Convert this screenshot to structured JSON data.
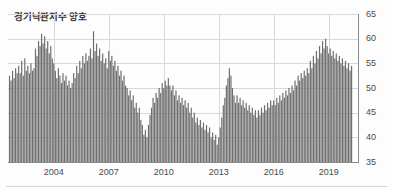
{
  "chart_data": {
    "type": "bar",
    "title": "경기낙관지수 양호",
    "xlabel": "",
    "ylabel": "",
    "ylim": [
      35,
      65
    ],
    "yticks": [
      35,
      40,
      45,
      50,
      55,
      60,
      65
    ],
    "xticks": [
      2004,
      2007,
      2010,
      2013,
      2016,
      2019
    ],
    "xlim": [
      2001.5,
      2020.6
    ],
    "grid": true,
    "legend": null,
    "bar_color": "#6e6e6e",
    "x_start": 2001.583,
    "x_step_months": 1,
    "categories": [
      "2001-08",
      "2001-09",
      "2001-10",
      "2001-11",
      "2001-12",
      "2002-01",
      "2002-02",
      "2002-03",
      "2002-04",
      "2002-05",
      "2002-06",
      "2002-07",
      "2002-08",
      "2002-09",
      "2002-10",
      "2002-11",
      "2002-12",
      "2003-01",
      "2003-02",
      "2003-03",
      "2003-04",
      "2003-05",
      "2003-06",
      "2003-07",
      "2003-08",
      "2003-09",
      "2003-10",
      "2003-11",
      "2003-12",
      "2004-01",
      "2004-02",
      "2004-03",
      "2004-04",
      "2004-05",
      "2004-06",
      "2004-07",
      "2004-08",
      "2004-09",
      "2004-10",
      "2004-11",
      "2004-12",
      "2005-01",
      "2005-02",
      "2005-03",
      "2005-04",
      "2005-05",
      "2005-06",
      "2005-07",
      "2005-08",
      "2005-09",
      "2005-10",
      "2005-11",
      "2005-12",
      "2006-01",
      "2006-02",
      "2006-03",
      "2006-04",
      "2006-05",
      "2006-06",
      "2006-07",
      "2006-08",
      "2006-09",
      "2006-10",
      "2006-11",
      "2006-12",
      "2007-01",
      "2007-02",
      "2007-03",
      "2007-04",
      "2007-05",
      "2007-06",
      "2007-07",
      "2007-08",
      "2007-09",
      "2007-10",
      "2007-11",
      "2007-12",
      "2008-01",
      "2008-02",
      "2008-03",
      "2008-04",
      "2008-05",
      "2008-06",
      "2008-07",
      "2008-08",
      "2008-09",
      "2008-10",
      "2008-11",
      "2008-12",
      "2009-01",
      "2009-02",
      "2009-03",
      "2009-04",
      "2009-05",
      "2009-06",
      "2009-07",
      "2009-08",
      "2009-09",
      "2009-10",
      "2009-11",
      "2009-12",
      "2010-01",
      "2010-02",
      "2010-03",
      "2010-04",
      "2010-05",
      "2010-06",
      "2010-07",
      "2010-08",
      "2010-09",
      "2010-10",
      "2010-11",
      "2010-12",
      "2011-01",
      "2011-02",
      "2011-03",
      "2011-04",
      "2011-05",
      "2011-06",
      "2011-07",
      "2011-08",
      "2011-09",
      "2011-10",
      "2011-11",
      "2011-12",
      "2012-01",
      "2012-02",
      "2012-03",
      "2012-04",
      "2012-05",
      "2012-06",
      "2012-07",
      "2012-08",
      "2012-09",
      "2012-10",
      "2012-11",
      "2012-12",
      "2013-01",
      "2013-02",
      "2013-03",
      "2013-04",
      "2013-05",
      "2013-06",
      "2013-07",
      "2013-08",
      "2013-09",
      "2013-10",
      "2013-11",
      "2013-12",
      "2014-01",
      "2014-02",
      "2014-03",
      "2014-04",
      "2014-05",
      "2014-06",
      "2014-07",
      "2014-08",
      "2014-09",
      "2014-10",
      "2014-11",
      "2014-12",
      "2015-01",
      "2015-02",
      "2015-03",
      "2015-04",
      "2015-05",
      "2015-06",
      "2015-07",
      "2015-08",
      "2015-09",
      "2015-10",
      "2015-11",
      "2015-12",
      "2016-01",
      "2016-02",
      "2016-03",
      "2016-04",
      "2016-05",
      "2016-06",
      "2016-07",
      "2016-08",
      "2016-09",
      "2016-10",
      "2016-11",
      "2016-12",
      "2017-01",
      "2017-02",
      "2017-03",
      "2017-04",
      "2017-05",
      "2017-06",
      "2017-07",
      "2017-08",
      "2017-09",
      "2017-10",
      "2017-11",
      "2017-12",
      "2018-01",
      "2018-02",
      "2018-03",
      "2018-04",
      "2018-05",
      "2018-06",
      "2018-07",
      "2018-08",
      "2018-09",
      "2018-10",
      "2018-11",
      "2018-12",
      "2019-01",
      "2019-02",
      "2019-03",
      "2019-04",
      "2019-05",
      "2019-06",
      "2019-07",
      "2019-08",
      "2019-09",
      "2019-10",
      "2019-11",
      "2019-12",
      "2020-01",
      "2020-02",
      "2020-03",
      "2020-04"
    ],
    "values": [
      52.5,
      51.5,
      53.5,
      52.0,
      54.0,
      53.0,
      54.5,
      53.0,
      55.5,
      52.5,
      56.0,
      53.5,
      54.5,
      53.0,
      55.0,
      53.5,
      54.0,
      58.0,
      56.5,
      59.5,
      58.5,
      61.0,
      59.0,
      60.5,
      58.0,
      59.5,
      57.0,
      58.5,
      56.0,
      55.0,
      53.5,
      52.0,
      54.0,
      52.5,
      51.0,
      53.0,
      51.5,
      52.5,
      50.5,
      51.5,
      50.0,
      51.0,
      53.0,
      52.0,
      54.5,
      53.0,
      55.5,
      54.0,
      56.5,
      55.0,
      57.0,
      55.5,
      56.5,
      58.0,
      56.0,
      61.5,
      57.5,
      59.0,
      56.5,
      58.0,
      55.5,
      57.0,
      55.0,
      56.0,
      54.0,
      57.5,
      55.5,
      56.5,
      54.5,
      55.5,
      53.5,
      54.5,
      52.5,
      53.5,
      51.5,
      52.5,
      50.5,
      50.0,
      48.5,
      49.5,
      47.5,
      48.5,
      46.0,
      47.0,
      45.0,
      46.0,
      43.5,
      42.5,
      40.5,
      41.5,
      40.0,
      42.5,
      44.5,
      46.0,
      48.0,
      47.0,
      49.0,
      48.0,
      50.0,
      49.0,
      51.0,
      50.0,
      51.5,
      50.5,
      52.0,
      50.5,
      49.5,
      50.5,
      48.5,
      49.5,
      47.5,
      48.5,
      47.0,
      48.0,
      46.5,
      47.5,
      46.0,
      47.0,
      45.0,
      46.0,
      44.0,
      45.0,
      43.0,
      44.0,
      42.5,
      43.5,
      42.0,
      43.0,
      41.5,
      42.5,
      41.0,
      42.0,
      40.0,
      41.0,
      39.5,
      40.5,
      38.5,
      40.0,
      42.0,
      44.0,
      46.5,
      48.0,
      50.5,
      52.0,
      54.0,
      52.5,
      50.0,
      48.5,
      47.0,
      48.5,
      47.0,
      48.0,
      46.5,
      47.5,
      46.0,
      47.0,
      45.5,
      46.5,
      45.0,
      46.0,
      44.5,
      45.5,
      44.0,
      45.5,
      44.5,
      46.0,
      45.0,
      46.5,
      45.5,
      47.0,
      46.0,
      47.5,
      46.5,
      47.5,
      46.5,
      48.0,
      47.0,
      48.5,
      47.5,
      49.0,
      48.0,
      49.5,
      48.5,
      50.0,
      49.0,
      50.5,
      49.5,
      51.5,
      50.5,
      52.5,
      51.5,
      53.0,
      52.0,
      53.5,
      52.5,
      54.0,
      53.0,
      55.5,
      54.0,
      56.5,
      55.0,
      57.5,
      56.0,
      58.5,
      57.0,
      59.5,
      58.0,
      60.0,
      58.5,
      57.0,
      58.0,
      56.5,
      57.5,
      56.0,
      57.0,
      55.5,
      56.5,
      55.0,
      56.0,
      54.5,
      55.5,
      54.0,
      55.0,
      53.5,
      54.5
    ]
  },
  "axis": {
    "y_labels": [
      "65",
      "60",
      "55",
      "50",
      "45",
      "40",
      "35"
    ],
    "x_labels": [
      "2004",
      "2007",
      "2010",
      "2013",
      "2016",
      "2019"
    ]
  }
}
